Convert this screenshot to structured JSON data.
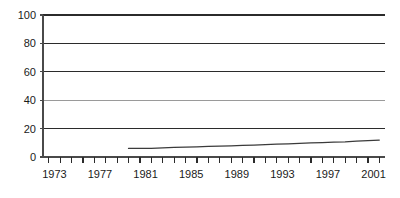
{
  "chart_data": {
    "type": "line",
    "title": "",
    "subtitle": "",
    "xlabel": "",
    "ylabel": "",
    "xlim": [
      1972.5,
      2002.5
    ],
    "ylim": [
      0,
      100
    ],
    "grid": true,
    "legend": null,
    "yticks": [
      0,
      20,
      40,
      60,
      80,
      100
    ],
    "ytick_labels": [
      "0",
      "20",
      "40",
      "60",
      "80",
      "100"
    ],
    "xtick_labels": [
      "1973",
      "1977",
      "1981",
      "1985",
      "1989",
      "1993",
      "1997",
      "2001"
    ],
    "xtick_label_years": [
      1973,
      1977,
      1981,
      1985,
      1989,
      1993,
      1997,
      2001
    ],
    "xminor_years": [
      1973,
      1974,
      1975,
      1976,
      1977,
      1978,
      1979,
      1980,
      1981,
      1982,
      1983,
      1984,
      1985,
      1986,
      1987,
      1988,
      1989,
      1990,
      1991,
      1992,
      1993,
      1994,
      1995,
      1996,
      1997,
      1998,
      1999,
      2000,
      2001,
      2002
    ],
    "series": [
      {
        "name": "series-1",
        "color": "#3b3b3b",
        "x": [
          1980,
          1981,
          1982,
          1983,
          1984,
          1985,
          1986,
          1987,
          1988,
          1989,
          1990,
          1991,
          1992,
          1993,
          1994,
          1995,
          1996,
          1997,
          1998,
          1999,
          2000,
          2001,
          2002
        ],
        "values": [
          6.0,
          6.0,
          6.1,
          6.4,
          6.7,
          7.0,
          7.2,
          7.4,
          7.6,
          7.9,
          8.2,
          8.4,
          8.7,
          9.0,
          9.3,
          9.6,
          9.9,
          10.1,
          10.4,
          10.7,
          11.2,
          11.6,
          11.9
        ]
      }
    ],
    "gridline_colors": {
      "100": "#2b2b2b",
      "80": "#2b2b2b",
      "60": "#2b2b2b",
      "40": "#9a9a9a",
      "20": "#2b2b2b",
      "0": "#2b2b2b"
    },
    "axis_color": "#4a4a4a"
  }
}
